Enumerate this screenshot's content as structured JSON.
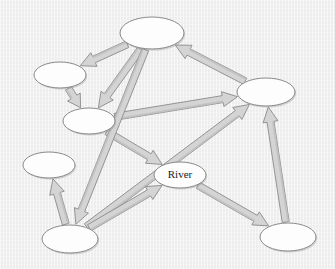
{
  "diagram": {
    "background_color": "#ededed",
    "node_fill": "#fdfdfd",
    "node_stroke": "#8a8a8a",
    "arrow_fill": "#d4d4d4",
    "arrow_fill_dark": "#bdbdbd",
    "arrow_stroke": "#8a8a8a",
    "label_color": "#1a1a1a",
    "nodes": [
      {
        "id": "n-top",
        "label": "",
        "cx": 152,
        "cy": 33,
        "rx": 32,
        "ry": 16
      },
      {
        "id": "n-upper-left",
        "label": "",
        "cx": 60,
        "cy": 75,
        "rx": 26,
        "ry": 13
      },
      {
        "id": "n-mid-left",
        "label": "",
        "cx": 89,
        "cy": 121,
        "rx": 26,
        "ry": 13
      },
      {
        "id": "n-left",
        "label": "",
        "cx": 49,
        "cy": 165,
        "rx": 26,
        "ry": 13
      },
      {
        "id": "n-bottom-left",
        "label": "",
        "cx": 70,
        "cy": 239,
        "rx": 28,
        "ry": 14
      },
      {
        "id": "n-river",
        "label": "River",
        "cx": 180,
        "cy": 175,
        "rx": 26,
        "ry": 13
      },
      {
        "id": "n-right",
        "label": "",
        "cx": 266,
        "cy": 92,
        "rx": 29,
        "ry": 14
      },
      {
        "id": "n-bottom-right",
        "label": "",
        "cx": 288,
        "cy": 237,
        "rx": 28,
        "ry": 14
      }
    ],
    "edges": [
      {
        "id": "e-top-upperleft",
        "from": "n-top",
        "to": "n-upper-left",
        "directed": true
      },
      {
        "id": "e-top-midleft",
        "from": "n-top",
        "to": "n-mid-left",
        "directed": true
      },
      {
        "id": "e-upperleft-midleft",
        "from": "n-upper-left",
        "to": "n-mid-left",
        "directed": true
      },
      {
        "id": "e-right-top",
        "from": "n-right",
        "to": "n-top",
        "directed": true
      },
      {
        "id": "e-midleft-right",
        "from": "n-mid-left",
        "to": "n-right",
        "directed": true
      },
      {
        "id": "e-bottomleft-right",
        "from": "n-bottom-left",
        "to": "n-right",
        "directed": true
      },
      {
        "id": "e-midleft-river",
        "from": "n-mid-left",
        "to": "n-river",
        "directed": true
      },
      {
        "id": "e-top-bottomleft",
        "from": "n-top",
        "to": "n-bottom-left",
        "directed": true
      },
      {
        "id": "e-bottomleft-left",
        "from": "n-bottom-left",
        "to": "n-left",
        "directed": true
      },
      {
        "id": "e-bottomleft-river",
        "from": "n-bottom-left",
        "to": "n-river",
        "directed": true
      },
      {
        "id": "e-river-bottomright",
        "from": "n-river",
        "to": "n-bottom-right",
        "directed": true
      },
      {
        "id": "e-bottomright-right",
        "from": "n-bottom-right",
        "to": "n-right",
        "directed": true
      }
    ]
  }
}
